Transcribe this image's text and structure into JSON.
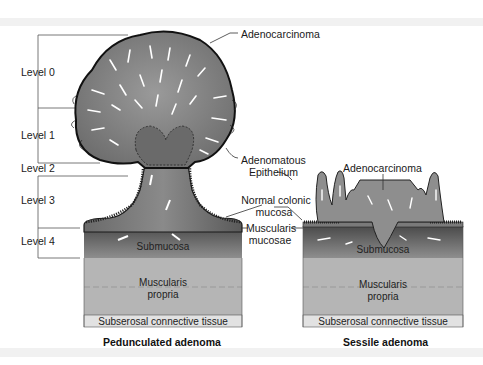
{
  "figure": {
    "levels": [
      {
        "label": "Level 0"
      },
      {
        "label": "Level 1"
      },
      {
        "label": "Level 2"
      },
      {
        "label": "Level 3"
      },
      {
        "label": "Level 4"
      }
    ],
    "annotations": {
      "adenocarcinoma_pedunculated": "Adenocarcinoma",
      "adenomatous_epithelium_1": "Adenomatous",
      "adenomatous_epithelium_2": "Epithelium",
      "normal_mucosa_1": "Normal colonic",
      "normal_mucosa_2": "mucosa",
      "muscularis_mucosae_1": "Muscularis",
      "muscularis_mucosae_2": "mucosae",
      "adenocarcinoma_sessile": "Adenocarcinoma"
    },
    "pedunculated": {
      "submucosa": "Submucosa",
      "muscularis_propria_1": "Muscularis",
      "muscularis_propria_2": "propria",
      "subserosal": "Subserosal connective tissue",
      "caption": "Pedunculated adenoma"
    },
    "sessile": {
      "submucosa": "Submucosa",
      "muscularis_propria_1": "Muscularis",
      "muscularis_propria_2": "propria",
      "subserosal": "Subserosal connective tissue",
      "caption": "Sessile adenoma"
    },
    "colors": {
      "submucosa_dark": "#5a5a5a",
      "submucosa_light": "#8c8c8c",
      "muscularis_propria": "#b5b5b5",
      "subserosal": "#e2e2e2",
      "tissue_outline": "#1a1a1a",
      "background_band": "#f1f1f1"
    }
  }
}
